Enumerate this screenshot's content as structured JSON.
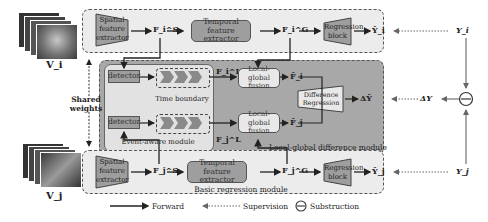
{
  "diagram": {
    "inputs": {
      "top": "V_i",
      "bottom": "V_j"
    },
    "shared_weights": "Shared\nweights",
    "top_branch": {
      "spatial": "Spatial feature extractor",
      "fs": "F_i^S",
      "temporal": "Temporal feature extractor",
      "fg": "F_i^G",
      "regression": "Regression block",
      "pred": "Ŷ_i",
      "label": "Y_i"
    },
    "bottom_branch": {
      "spatial": "Spatial feature extractor",
      "fs": "F_j^S",
      "temporal": "Temporal feature extractor",
      "fg": "F_j^G",
      "regression": "Regression block",
      "pred": "Ŷ_j",
      "label": "Y_j",
      "module_label": "Basic regression module"
    },
    "middle": {
      "detector_top": "detector",
      "detector_bottom": "detector",
      "time_boundary": "Time boundary",
      "event_module": "Event-aware module",
      "fl_i": "F_i^L",
      "fl_j": "F_j^L",
      "fusion_top": "Local-global fusion",
      "fusion_bottom": "Local-global fusion",
      "fbar_i": "F̄_i",
      "fbar_j": "F̄_j",
      "diff_reg": "Difference Regression",
      "delta_pred": "ΔŶ",
      "delta_y": "ΔY",
      "module_label": "Local-global difference module"
    },
    "legend": {
      "forward": "Forward",
      "supervision": "Supervision",
      "subtraction": "Substruction"
    }
  },
  "colors": {
    "frame_light": "#ececec",
    "frame_dark": "#a8a8a8",
    "inner_light": "#e4e4e4",
    "block": "#9e9e9e",
    "chevron": "#8a8a8a"
  }
}
